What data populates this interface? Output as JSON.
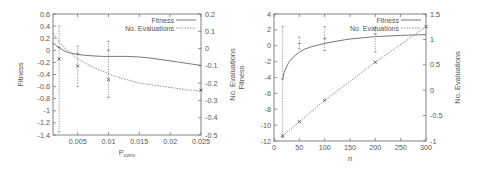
{
  "chart_data": [
    {
      "type": "line",
      "title": "",
      "xlabel": "P_conv",
      "xlabel_main": "P",
      "xlabel_sub": "conv",
      "ylabel": "Fitness",
      "y2label": "No. Evaluations",
      "xlim": [
        0.001,
        0.025
      ],
      "ylim": [
        -1.4,
        0.6
      ],
      "y2lim": [
        -0.5,
        0.2
      ],
      "x_ticks": [
        "0.005",
        "0.01",
        "0.015",
        "0.02",
        "0.025"
      ],
      "x_tick_values": [
        0.005,
        0.01,
        0.015,
        0.02,
        0.025
      ],
      "y_ticks": [
        "0.6",
        "0.4",
        "0.2",
        "0",
        "-0.2",
        "-0.4",
        "-0.6",
        "-0.8",
        "-1",
        "-1.2",
        "-1.4"
      ],
      "y_tick_values": [
        0.6,
        0.4,
        0.2,
        0,
        -0.2,
        -0.4,
        -0.6,
        -0.8,
        -1,
        -1.2,
        -1.4
      ],
      "y2_ticks": [
        "0.2",
        "0.1",
        "0",
        "-0.1",
        "-0.2",
        "-0.3",
        "-0.4",
        "-0.5"
      ],
      "y2_tick_values": [
        0.2,
        0.1,
        0,
        -0.1,
        -0.2,
        -0.3,
        -0.4,
        -0.5
      ],
      "legend": {
        "position": "top-right",
        "entries": [
          "Fitness",
          "No. Evaluations"
        ]
      },
      "grid": false,
      "series": [
        {
          "name": "Fitness",
          "style": "solid",
          "axis": "left",
          "x": [
            0.001,
            0.002,
            0.003,
            0.004,
            0.005,
            0.007,
            0.009,
            0.011,
            0.013,
            0.015,
            0.017,
            0.019,
            0.021,
            0.023,
            0.025
          ],
          "values": [
            0.12,
            0.04,
            -0.02,
            -0.05,
            -0.07,
            -0.09,
            -0.1,
            -0.1,
            -0.1,
            -0.11,
            -0.13,
            -0.16,
            -0.19,
            -0.22,
            -0.25
          ],
          "points": {
            "x": [
              0.002,
              0.005,
              0.01
            ],
            "values": [
              0.05,
              -0.05,
              0.0
            ],
            "err_low": [
              -1.35,
              -0.6,
              -0.78
            ],
            "err_high": [
              0.4,
              0.07,
              0.15
            ]
          }
        },
        {
          "name": "No. Evaluations",
          "style": "dashed",
          "axis": "right",
          "x": [
            0.001,
            0.002,
            0.003,
            0.004,
            0.005,
            0.007,
            0.009,
            0.011,
            0.013,
            0.015,
            0.017,
            0.019,
            0.021,
            0.023,
            0.025
          ],
          "values": [
            0.09,
            0.04,
            0.0,
            -0.03,
            -0.06,
            -0.1,
            -0.13,
            -0.16,
            -0.18,
            -0.2,
            -0.21,
            -0.22,
            -0.23,
            -0.24,
            -0.245
          ],
          "points": {
            "x": [
              0.002,
              0.005,
              0.01,
              0.025
            ],
            "values": [
              -0.06,
              -0.1,
              -0.18,
              -0.24
            ]
          }
        }
      ]
    },
    {
      "type": "line",
      "title": "",
      "xlabel": "n",
      "ylabel": "Fitness",
      "y2label": "No. Evaluations",
      "xlim": [
        0,
        300
      ],
      "ylim": [
        -12,
        4
      ],
      "y2lim": [
        -1,
        1.5
      ],
      "x_ticks": [
        "0",
        "50",
        "100",
        "150",
        "200",
        "250",
        "300"
      ],
      "x_tick_values": [
        0,
        50,
        100,
        150,
        200,
        250,
        300
      ],
      "y_ticks": [
        "4",
        "2",
        "0",
        "-2",
        "-4",
        "-6",
        "-8",
        "-10",
        "-12"
      ],
      "y_tick_values": [
        4,
        2,
        0,
        -2,
        -4,
        -6,
        -8,
        -10,
        -12
      ],
      "y2_ticks": [
        "1.5",
        "1",
        "0.5",
        "0",
        "-0.5",
        "-1"
      ],
      "y2_tick_values": [
        1.5,
        1,
        0.5,
        0,
        -0.5,
        -1
      ],
      "legend": {
        "position": "top-right",
        "entries": [
          "Fitness",
          "No. Evaluations"
        ]
      },
      "grid": false,
      "series": [
        {
          "name": "Fitness",
          "style": "solid",
          "axis": "left",
          "x": [
            17,
            20,
            25,
            30,
            40,
            50,
            60,
            75,
            100,
            125,
            150,
            175,
            200,
            250,
            300
          ],
          "values": [
            -4.2,
            -3.4,
            -2.6,
            -2.0,
            -1.3,
            -0.8,
            -0.45,
            -0.1,
            0.3,
            0.6,
            0.85,
            1.0,
            1.15,
            1.3,
            1.4
          ],
          "points": {
            "x": [
              17,
              50,
              100,
              200
            ],
            "values": [
              -4.2,
              0.3,
              0.9,
              1.5
            ],
            "err_low": [
              -11.5,
              -0.4,
              -0.6,
              -0.8
            ],
            "err_high": [
              2.4,
              1.1,
              2.4,
              2.3
            ]
          }
        },
        {
          "name": "No. Evaluations",
          "style": "dashed",
          "axis": "right",
          "x": [
            17,
            50,
            100,
            200,
            300
          ],
          "values": [
            -0.9,
            -0.62,
            -0.2,
            0.55,
            1.25
          ],
          "points": {
            "x": [
              17,
              50,
              100,
              200,
              300
            ],
            "values": [
              -0.9,
              -0.62,
              -0.2,
              0.55,
              1.25
            ]
          }
        }
      ]
    }
  ],
  "frames": [
    {
      "left": 53,
      "top": 14,
      "right": 201,
      "bottom": 135
    },
    {
      "left": 274,
      "top": 14,
      "right": 426,
      "bottom": 141
    }
  ]
}
